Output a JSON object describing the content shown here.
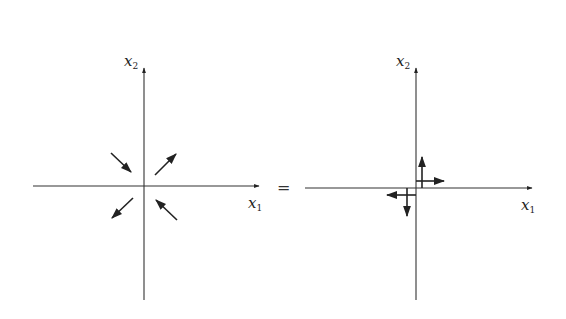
{
  "colors": {
    "ink": "#222222",
    "background": "#ffffff"
  },
  "equals_sign": "=",
  "left_plot": {
    "x_axis_label": {
      "var": "x",
      "sub": "1"
    },
    "y_axis_label": {
      "var": "x",
      "sub": "2"
    },
    "vectors": [
      {
        "name": "upper-left-inward",
        "from": [
          111,
          153
        ],
        "to": [
          131,
          172
        ]
      },
      {
        "name": "upper-right-outward",
        "from": [
          155,
          175
        ],
        "to": [
          176,
          154
        ]
      },
      {
        "name": "lower-left-outward",
        "from": [
          133,
          198
        ],
        "to": [
          112,
          218
        ]
      },
      {
        "name": "lower-right-inward",
        "from": [
          177,
          220
        ],
        "to": [
          156,
          200
        ]
      }
    ]
  },
  "right_plot": {
    "x_axis_label": {
      "var": "x",
      "sub": "1"
    },
    "y_axis_label": {
      "var": "x",
      "sub": "2"
    },
    "vectors": [
      {
        "name": "up",
        "from": [
          422,
          188
        ],
        "to": [
          422,
          157
        ]
      },
      {
        "name": "right",
        "from": [
          416,
          181
        ],
        "to": [
          444,
          181
        ]
      },
      {
        "name": "down",
        "from": [
          407,
          188
        ],
        "to": [
          407,
          216
        ]
      },
      {
        "name": "left",
        "from": [
          416,
          195
        ],
        "to": [
          387,
          195
        ]
      }
    ]
  }
}
